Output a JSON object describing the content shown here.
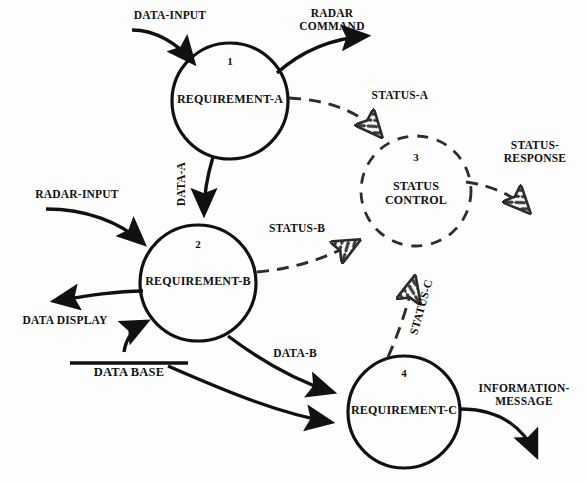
{
  "diagram": {
    "type": "data-flow-diagram",
    "title": "",
    "background_color": "#fdfdfd",
    "line_color": "#111111",
    "control_flow_style": "dashed",
    "data_flow_style": "solid"
  },
  "processes": [
    {
      "id": "p1",
      "number": "1",
      "name": "REQUIREMENT-A",
      "shape": "circle",
      "cx": 230,
      "cy": 101,
      "r": 58,
      "style": "solid"
    },
    {
      "id": "p2",
      "number": "2",
      "name": "REQUIREMENT-B",
      "shape": "circle",
      "cx": 198,
      "cy": 283,
      "r": 58,
      "style": "solid"
    },
    {
      "id": "p3",
      "number": "3",
      "name": "STATUS\nCONTROL",
      "name_line1": "STATUS",
      "name_line2": "CONTROL",
      "shape": "circle",
      "cx": 416,
      "cy": 191,
      "r": 55,
      "style": "dashed"
    },
    {
      "id": "p4",
      "number": "4",
      "name": "REQUIREMENT-C",
      "shape": "circle",
      "cx": 404,
      "cy": 412,
      "r": 56,
      "style": "solid"
    }
  ],
  "stores": [
    {
      "id": "s1",
      "label": "DATA BASE",
      "x": 70,
      "y": 363,
      "width": 118
    }
  ],
  "flows": [
    {
      "id": "f1",
      "label": "DATA-INPUT",
      "kind": "data",
      "from": "external",
      "to": "p1",
      "rotated": false
    },
    {
      "id": "f2",
      "label": "RADAR\nCOMMAND",
      "line1": "RADAR",
      "line2": "COMMAND",
      "kind": "data",
      "from": "p1",
      "to": "external",
      "rotated": false
    },
    {
      "id": "f3",
      "label": "STATUS-A",
      "kind": "control",
      "from": "p1",
      "to": "p3",
      "rotated": false
    },
    {
      "id": "f4",
      "label": "DATA-A",
      "kind": "data",
      "from": "p1",
      "to": "p2",
      "rotated": true
    },
    {
      "id": "f5",
      "label": "RADAR-INPUT",
      "kind": "data",
      "from": "external",
      "to": "p2",
      "rotated": false
    },
    {
      "id": "f6",
      "label": "DATA DISPLAY",
      "kind": "data",
      "from": "p2",
      "to": "external",
      "rotated": false
    },
    {
      "id": "f7",
      "label": "STATUS-B",
      "kind": "control",
      "from": "p2",
      "to": "p3",
      "rotated": false
    },
    {
      "id": "f8",
      "label": "STATUS-RESPONSE",
      "line1": "STATUS-",
      "line2": "RESPONSE",
      "kind": "control",
      "from": "p3",
      "to": "external",
      "rotated": false
    },
    {
      "id": "f9",
      "label": "STATUS-C",
      "kind": "control",
      "from": "p4",
      "to": "p3",
      "rotated": true
    },
    {
      "id": "f10",
      "label": "DATA-B",
      "kind": "data",
      "from": "p2",
      "to": "p4",
      "rotated": false
    },
    {
      "id": "f11",
      "label": "",
      "kind": "data",
      "from": "s1",
      "to": "p4",
      "rotated": false
    },
    {
      "id": "f12",
      "label": "",
      "kind": "data",
      "from": "p2",
      "to": "s1",
      "rotated": false
    },
    {
      "id": "f13",
      "label": "INFORMATION-MESSAGE",
      "line1": "INFORMATION-",
      "line2": "MESSAGE",
      "kind": "data",
      "from": "p4",
      "to": "external",
      "rotated": false
    }
  ],
  "labels": {
    "data_input": "DATA-INPUT",
    "radar_command_1": "RADAR",
    "radar_command_2": "COMMAND",
    "status_a": "STATUS-A",
    "data_a": "DATA-A",
    "radar_input": "RADAR-INPUT",
    "data_display": "DATA DISPLAY",
    "status_b": "STATUS-B",
    "status_response_1": "STATUS-",
    "status_response_2": "RESPONSE",
    "status_c": "STATUS-C",
    "data_b": "DATA-B",
    "data_base": "DATA BASE",
    "information_message_1": "INFORMATION-",
    "information_message_2": "MESSAGE",
    "status_control_1": "STATUS",
    "status_control_2": "CONTROL",
    "req_a": "REQUIREMENT-A",
    "req_b": "REQUIREMENT-B",
    "req_c": "REQUIREMENT-C",
    "num1": "1",
    "num2": "2",
    "num3": "3",
    "num4": "4"
  }
}
